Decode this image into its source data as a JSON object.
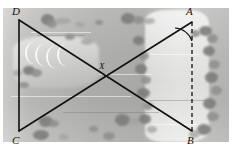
{
  "figure": {
    "type": "geometry-overlay-on-aerial-photograph",
    "background_description": "grayscale aerial photograph of farmland with tree clusters",
    "colors": {
      "line": "#111111",
      "label": "#111111",
      "photo_base": "#b6b6b4",
      "tree": "#8e8e8c",
      "page": "#ffffff"
    },
    "vertices": [
      {
        "id": "D",
        "label": "D",
        "x": 19,
        "y": 20,
        "label_x": 12,
        "label_y": 6
      },
      {
        "id": "A",
        "label": "A",
        "x": 192,
        "y": 22,
        "label_x": 186,
        "label_y": 6
      },
      {
        "id": "C",
        "label": "C",
        "x": 19,
        "y": 131,
        "label_x": 12,
        "label_y": 135
      },
      {
        "id": "B",
        "label": "B",
        "x": 192,
        "y": 131,
        "label_x": 187,
        "label_y": 135
      },
      {
        "id": "X",
        "label": "X",
        "x": 106,
        "y": 76,
        "label_x": 99,
        "label_y": 62
      }
    ],
    "segments": [
      {
        "name": "side-DC",
        "from": "D",
        "to": "C",
        "style": "solid"
      },
      {
        "name": "diagonal-DB",
        "from": "D",
        "to": "B",
        "style": "solid"
      },
      {
        "name": "diagonal-CA",
        "from": "C",
        "to": "A",
        "style": "solid"
      },
      {
        "name": "segment-AB",
        "from": "A",
        "to": "B",
        "style": "dashed"
      }
    ],
    "angle_marks": [
      {
        "name": "angle-at-A",
        "at": "A",
        "between": [
          "diagonal-CA",
          "segment-AB"
        ]
      }
    ],
    "intersection": {
      "name": "diagonals-intersection",
      "label": "X",
      "of": [
        "diagonal-DB",
        "diagonal-CA"
      ]
    }
  }
}
